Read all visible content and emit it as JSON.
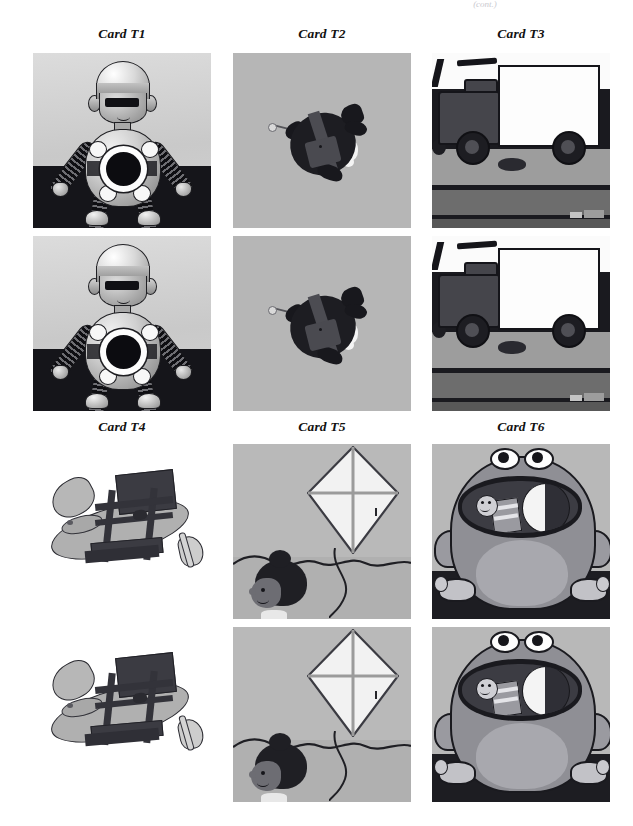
{
  "page": {
    "cutoff_header": "(cont.)",
    "background_color": "#ffffff",
    "width": 633,
    "height": 826
  },
  "figure": {
    "layout": "3-column grid, two label rows, each card shown twice (stacked duplicate panels)",
    "label_style": "italic-bold-serif",
    "panel_background": "#b9b9b9",
    "cards": [
      {
        "id": "T1",
        "label": "Card T1",
        "subject": "robot",
        "description": "Grey 3D-rendered toy robot with visor eyes, segmented arms and legs, round black chest core, standing behind a dark black bar",
        "background": "#cfcfcf",
        "repeat_count": 2,
        "column": 1,
        "row_group": 1
      },
      {
        "id": "T2",
        "label": "Card T2",
        "subject": "turtle",
        "description": "Dark silhouette turtle with shell plate and flippers on a flat grey background, small ring-and-stick at left",
        "background": "#b6b6b6",
        "repeat_count": 2,
        "column": 2,
        "row_group": 1
      },
      {
        "id": "T3",
        "label": "Card T3",
        "subject": "truck",
        "description": "Cartoon delivery truck with white cargo box, dark cab and two black wheels on a grey road with dark bands",
        "background": "#9d9d9d",
        "repeat_count": 2,
        "column": 3,
        "row_group": 1
      },
      {
        "id": "T4",
        "label": "Card T4",
        "subject": "airplane with chair",
        "description": "Grey propeller airplane drawing overlaid by a dark chair outline, on a plain white background",
        "background": "#ffffff",
        "repeat_count": 2,
        "column": 1,
        "row_group": 2
      },
      {
        "id": "T5",
        "label": "Card T5",
        "subject": "kite",
        "description": "Child with dark curly hair watching a large white diamond kite with cross spars, string trailing down over a hill line",
        "background": "#b9b9b9",
        "repeat_count": 2,
        "column": 2,
        "row_group": 2
      },
      {
        "id": "T6",
        "label": "Card T6",
        "subject": "frog",
        "description": "Large grey cartoon frog with wide open mouth containing a small smiling figure and a black-and-white ball",
        "background": "#b8b8b8",
        "repeat_count": 2,
        "column": 3,
        "row_group": 2
      }
    ]
  }
}
